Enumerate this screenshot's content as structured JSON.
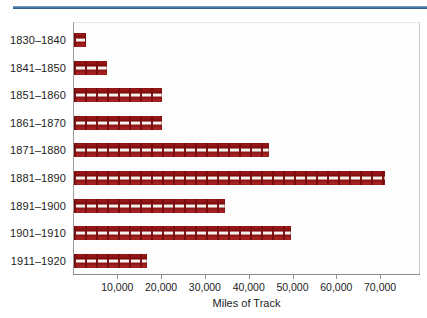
{
  "chart_data": {
    "type": "bar",
    "orientation": "horizontal",
    "title": "",
    "xlabel": "Miles of Track",
    "ylabel": "",
    "categories": [
      "1830–1840",
      "1841–1850",
      "1851–1860",
      "1861–1870",
      "1871–1880",
      "1881–1890",
      "1891–1900",
      "1901–1910",
      "1911–1920"
    ],
    "values": [
      2800,
      7500,
      20000,
      20000,
      44500,
      71000,
      34500,
      49500,
      16600
    ],
    "xlim": [
      0,
      77000
    ],
    "xticks": [
      10000,
      20000,
      30000,
      40000,
      50000,
      60000,
      70000
    ],
    "xtick_labels": [
      "10,000",
      "20,000",
      "30,000",
      "40,000",
      "50,000",
      "60,000",
      "70,000"
    ],
    "grid": false,
    "legend": null,
    "series_color": "#8f1212",
    "accent_rule_color": "#4a7aa6"
  },
  "figure": {
    "top_rule_color": "#4a7aa6",
    "plot_background": "#fdfdfd",
    "axis_color": "#8d8d8d"
  }
}
